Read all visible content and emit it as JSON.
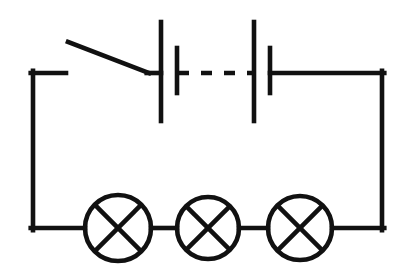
{
  "diagram": {
    "canvas": {
      "width": 412,
      "height": 278,
      "background": "#ffffff"
    },
    "stroke_color": "#111111",
    "stroke_width": 4.6,
    "loop": {
      "label": "circuit-loop-wire",
      "left_x": 33,
      "right_x": 382,
      "top_y": 73,
      "bottom_y": 228
    },
    "switch": {
      "label": "open-switch",
      "state": "open",
      "stub_from_x": 33,
      "stub_to_x": 66,
      "stub_y": 73,
      "blade_x1": 68,
      "blade_y1": 42,
      "blade_x2": 149,
      "blade_y2": 73
    },
    "battery": {
      "label": "multi-cell-battery",
      "cell_count": 2,
      "plates": [
        {
          "name": "long-plate-1",
          "kind": "long",
          "x": 161,
          "y_top": 22,
          "y_bottom": 121
        },
        {
          "name": "short-plate-1",
          "kind": "short",
          "x": 177,
          "y_top": 48,
          "y_bottom": 93
        },
        {
          "name": "long-plate-2",
          "kind": "long",
          "x": 254,
          "y_top": 22,
          "y_bottom": 121
        },
        {
          "name": "short-plate-2",
          "kind": "short",
          "x": 270,
          "y_top": 48,
          "y_bottom": 93
        }
      ],
      "link": {
        "name": "dashed-cell-link",
        "y": 73,
        "x_start": 178,
        "x_end": 254,
        "dash": "11 12"
      },
      "lead_left": {
        "from_x": 149,
        "to_x": 161,
        "y": 73
      },
      "lead_right": {
        "from_x": 270,
        "to_x": 382,
        "y": 73
      }
    },
    "lamps": [
      {
        "name": "lamp-1",
        "cx": 118,
        "cy": 228,
        "r": 33
      },
      {
        "name": "lamp-2",
        "cx": 208,
        "cy": 228,
        "r": 31
      },
      {
        "name": "lamp-3",
        "cx": 300,
        "cy": 228,
        "r": 32
      }
    ],
    "bottom_segments": [
      {
        "name": "wire-left-to-lamp1",
        "x1": 33,
        "x2": 85,
        "y": 228
      },
      {
        "name": "wire-lamp1-to-lamp2",
        "x1": 151,
        "x2": 177,
        "y": 228
      },
      {
        "name": "wire-lamp2-to-lamp3",
        "x1": 239,
        "x2": 268,
        "y": 228
      },
      {
        "name": "wire-lamp3-to-right",
        "x1": 332,
        "x2": 382,
        "y": 228
      }
    ]
  }
}
